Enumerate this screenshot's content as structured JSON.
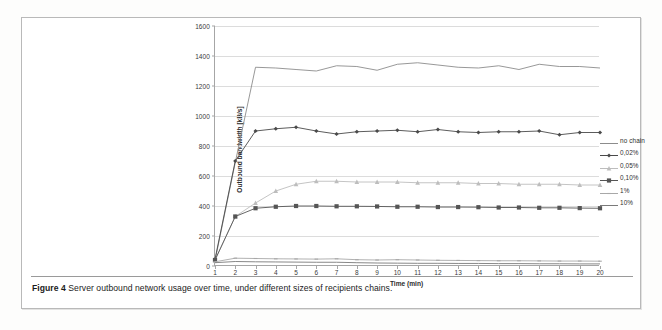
{
  "figure": {
    "caption_prefix": "Figure 4",
    "caption_text": "Server outbound network usage over time, under different sizes of recipients chains."
  },
  "chart_data": {
    "type": "line",
    "title": "",
    "xlabel": "Time (min)",
    "ylabel": "Outbound bandwidth [kB/s]",
    "xlim": [
      1,
      20
    ],
    "ylim": [
      0,
      1600
    ],
    "ytick_step": 200,
    "grid": true,
    "legend_position": "right",
    "x": [
      1,
      2,
      3,
      4,
      5,
      6,
      7,
      8,
      9,
      10,
      11,
      12,
      13,
      14,
      15,
      16,
      17,
      18,
      19,
      20
    ],
    "xticks": [
      "1",
      "2",
      "3",
      "4",
      "5",
      "6",
      "7",
      "8",
      "9",
      "10",
      "11",
      "12",
      "13",
      "14",
      "15",
      "16",
      "17",
      "18",
      "19",
      "20"
    ],
    "yticks": [
      "0",
      "200",
      "400",
      "600",
      "800",
      "1000",
      "1200",
      "1400",
      "1600"
    ],
    "series": [
      {
        "name": "no chain",
        "color": "#8c8c8c",
        "marker": "none",
        "values": [
          35,
          690,
          1325,
          1320,
          1310,
          1300,
          1335,
          1330,
          1305,
          1345,
          1355,
          1340,
          1325,
          1320,
          1335,
          1310,
          1345,
          1330,
          1330,
          1320
        ]
      },
      {
        "name": "0,02%",
        "color": "#4a4a4a",
        "marker": "diamond",
        "values": [
          45,
          700,
          900,
          915,
          925,
          900,
          880,
          895,
          900,
          905,
          895,
          910,
          895,
          890,
          895,
          895,
          900,
          875,
          890,
          890
        ]
      },
      {
        "name": "0,05%",
        "color": "#bdbdbd",
        "marker": "triangle",
        "values": [
          38,
          330,
          420,
          500,
          545,
          565,
          565,
          560,
          560,
          560,
          555,
          555,
          555,
          550,
          550,
          545,
          545,
          545,
          540,
          540
        ]
      },
      {
        "name": "0,10%",
        "color": "#555555",
        "marker": "square",
        "values": [
          40,
          330,
          385,
          395,
          400,
          400,
          398,
          398,
          397,
          395,
          395,
          393,
          393,
          392,
          390,
          390,
          388,
          388,
          386,
          385
        ]
      },
      {
        "name": "1%",
        "color": "#a8a8a8",
        "marker": "dash",
        "values": [
          28,
          52,
          50,
          48,
          47,
          46,
          48,
          42,
          40,
          42,
          40,
          38,
          37,
          36,
          35,
          35,
          34,
          33,
          33,
          32
        ]
      },
      {
        "name": "10%",
        "color": "#7a7a7a",
        "marker": "none",
        "values": [
          22,
          30,
          28,
          27,
          26,
          25,
          25,
          22,
          20,
          19,
          18,
          18,
          17,
          17,
          16,
          16,
          15,
          15,
          14,
          14
        ]
      }
    ]
  }
}
